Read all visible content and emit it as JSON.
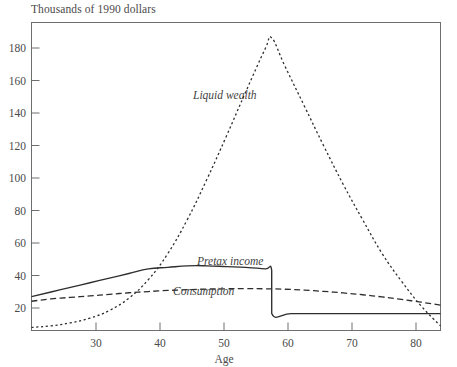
{
  "chart_data": {
    "type": "line",
    "title": "Thousands of 1990 dollars",
    "xlabel": "Age",
    "ylabel": "Thousands of 1990 dollars",
    "xlim": [
      25,
      88
    ],
    "ylim": [
      0,
      200
    ],
    "xticks": [
      30,
      40,
      50,
      60,
      70,
      80
    ],
    "yticks": [
      20,
      40,
      60,
      80,
      100,
      120,
      140,
      160,
      180
    ],
    "grid": false,
    "legend_position": "inline-annotations",
    "annotations": [
      {
        "text": "Liquid wealth",
        "x": 57,
        "y": 152
      },
      {
        "text": "Pretax income",
        "x": 57,
        "y": 46
      },
      {
        "text": "Consumption",
        "x": 50,
        "y": 22
      }
    ],
    "series": [
      {
        "name": "Liquid wealth",
        "style": "dotted",
        "x": [
          25,
          28,
          31,
          34,
          37,
          40,
          43,
          46,
          49,
          52,
          55,
          58,
          61,
          62,
          64,
          67,
          70,
          73,
          76,
          79,
          82,
          85,
          88
        ],
        "values": [
          2,
          3,
          5,
          8,
          13,
          21,
          33,
          50,
          72,
          98,
          126,
          155,
          183,
          190,
          172,
          146,
          120,
          95,
          72,
          50,
          32,
          16,
          3
        ]
      },
      {
        "name": "Pretax income",
        "style": "solid",
        "x": [
          25,
          28,
          31,
          34,
          37,
          40,
          43,
          46,
          49,
          52,
          55,
          58,
          61,
          62,
          62,
          65,
          70,
          75,
          80,
          85,
          88
        ],
        "values": [
          22,
          25,
          28,
          31,
          34,
          37,
          40,
          41,
          42,
          42,
          41.5,
          41,
          40,
          39,
          11,
          11,
          11,
          11,
          11,
          11,
          11
        ]
      },
      {
        "name": "Consumption",
        "style": "dashed",
        "x": [
          25,
          28,
          31,
          34,
          37,
          40,
          43,
          46,
          49,
          52,
          55,
          58,
          61,
          64,
          67,
          70,
          73,
          76,
          79,
          82,
          85,
          88
        ],
        "values": [
          19,
          20.5,
          21.5,
          22.5,
          23.5,
          24.5,
          25.3,
          26,
          26.5,
          26.9,
          27.1,
          27.2,
          27.1,
          26.8,
          26.2,
          25.4,
          24.4,
          23.2,
          21.8,
          20.2,
          18.4,
          16.5
        ]
      }
    ]
  },
  "axis": {
    "y_title": "Thousands of 1990 dollars",
    "x_title": "Age",
    "y_tick_labels": [
      "180",
      "160",
      "140",
      "120",
      "100",
      "80",
      "60",
      "40",
      "20"
    ],
    "x_tick_labels": [
      "30",
      "40",
      "50",
      "60",
      "70",
      "80"
    ]
  },
  "labels": {
    "liquid_wealth": "Liquid wealth",
    "pretax_income": "Pretax income",
    "consumption": "Consumption"
  }
}
